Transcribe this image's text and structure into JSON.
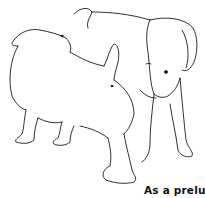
{
  "illustration": {
    "subject": "two-puppies-line-drawing",
    "line_color": "#1a1a1a",
    "background": "#ffffff"
  },
  "caption": {
    "text": "As a prelude"
  }
}
